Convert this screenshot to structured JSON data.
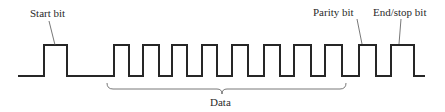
{
  "diagram": {
    "labels": {
      "start": "Start bit",
      "parity": "Parity bit",
      "stop": "End/stop bit",
      "data": "Data"
    },
    "colors": {
      "line": "#262626",
      "leader": "#555555",
      "text": "#2a2a2a"
    },
    "waveform": {
      "baseline_y": 76,
      "high_y": 45,
      "x_start": 18,
      "x_end": 425,
      "pulses": [
        {
          "role": "start",
          "rise": 44,
          "fall": 67
        },
        {
          "role": "data",
          "rise": 114,
          "fall": 129
        },
        {
          "role": "data",
          "rise": 143,
          "fall": 159
        },
        {
          "role": "data",
          "rise": 172,
          "fall": 187
        },
        {
          "role": "data",
          "rise": 202,
          "fall": 217
        },
        {
          "role": "data",
          "rise": 232,
          "fall": 248
        },
        {
          "role": "data",
          "rise": 264,
          "fall": 280
        },
        {
          "role": "data",
          "rise": 294,
          "fall": 311
        },
        {
          "role": "data",
          "rise": 325,
          "fall": 342
        },
        {
          "role": "parity",
          "rise": 359,
          "fall": 376
        },
        {
          "role": "stop",
          "rise": 391,
          "fall": 414
        }
      ]
    },
    "brace": {
      "x1": 107,
      "x2": 346,
      "y": 86,
      "tip_x": 222
    }
  }
}
